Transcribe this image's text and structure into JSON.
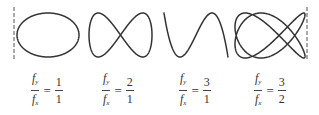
{
  "figure": {
    "stroke_color": "#333333",
    "guides": [
      {
        "name": "left-boundary",
        "x": 14,
        "y1": 7,
        "y2": 59
      },
      {
        "name": "right-boundary",
        "x": 307,
        "y1": 7,
        "y2": 59
      }
    ],
    "panels": [
      {
        "id": "ratio-1-1",
        "fy": 1,
        "fx": 1,
        "phase": 1.5708,
        "box": {
          "x": 17,
          "y": 13,
          "w": 62,
          "h": 44
        },
        "formula": {
          "num_symbol": "f",
          "num_sub": "y",
          "den_symbol": "f",
          "den_sub": "x",
          "equals": "=",
          "rhs_num": "1",
          "rhs_den": "1"
        },
        "formula_left": 31
      },
      {
        "id": "ratio-2-1",
        "fy": 2,
        "fx": 1,
        "phase": 0,
        "box": {
          "x": 89,
          "y": 13,
          "w": 63,
          "h": 44
        },
        "formula": {
          "num_symbol": "f",
          "num_sub": "y",
          "den_symbol": "f",
          "den_sub": "x",
          "equals": "=",
          "rhs_num": "2",
          "rhs_den": "1"
        },
        "formula_left": 102
      },
      {
        "id": "ratio-3-1",
        "fy": 3,
        "fx": 1,
        "phase": 0,
        "box": {
          "x": 164,
          "y": 13,
          "w": 64,
          "h": 44
        },
        "formula": {
          "num_symbol": "f",
          "num_sub": "y",
          "den_symbol": "f",
          "den_sub": "x",
          "equals": "=",
          "rhs_num": "3",
          "rhs_den": "1"
        },
        "formula_left": 179
      },
      {
        "id": "ratio-3-2",
        "fy": 3,
        "fx": 2,
        "phase": 0.7854,
        "box": {
          "x": 235,
          "y": 13,
          "w": 70,
          "h": 45
        },
        "formula": {
          "num_symbol": "f",
          "num_sub": "y",
          "den_symbol": "f",
          "den_sub": "x",
          "equals": "=",
          "rhs_num": "3",
          "rhs_den": "2"
        },
        "formula_left": 254
      }
    ]
  }
}
